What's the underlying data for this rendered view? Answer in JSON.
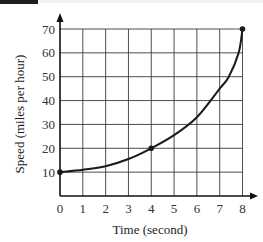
{
  "chart_data": {
    "type": "line",
    "title": "",
    "xlabel": "Time (second)",
    "ylabel": "Speed (miles per hour)",
    "x_ticks": [
      0,
      1,
      2,
      3,
      4,
      5,
      6,
      7,
      8
    ],
    "y_ticks": [
      10,
      20,
      30,
      40,
      50,
      60,
      70
    ],
    "xlim": [
      0,
      8
    ],
    "ylim": [
      0,
      70
    ],
    "grid": true,
    "legend": null,
    "series": [
      {
        "name": "Speed",
        "x": [
          0,
          1,
          2,
          3,
          4,
          5,
          6,
          7,
          7.4,
          7.83,
          8
        ],
        "y": [
          10,
          11,
          12.5,
          15.5,
          20,
          25.5,
          33,
          45,
          50,
          60,
          70
        ]
      }
    ],
    "marked_points": [
      {
        "x": 0,
        "y": 10
      },
      {
        "x": 4,
        "y": 20
      },
      {
        "x": 8,
        "y": 70
      }
    ]
  },
  "labels": {
    "xlabel": "Time (second)",
    "ylabel": "Speed (miles per hour)",
    "x_tick_labels": [
      "0",
      "1",
      "2",
      "3",
      "4",
      "5",
      "6",
      "7",
      "8"
    ],
    "y_tick_labels": [
      "10",
      "20",
      "30",
      "40",
      "50",
      "60",
      "70"
    ]
  },
  "colors": {
    "grid": "#3a3a3a",
    "curve": "#1a1a1a",
    "axis": "#111111"
  }
}
